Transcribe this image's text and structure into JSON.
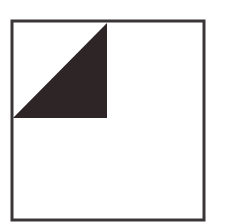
{
  "diagram": {
    "colors": {
      "background": "#ffffff",
      "outline": "#3a3636",
      "triangle_fill": "#2e2626"
    },
    "square": {
      "x": 12,
      "y": 21,
      "width": 192,
      "height": 199,
      "stroke_width": 3
    },
    "triangle": {
      "points": "13,118 107,23 107,118"
    }
  }
}
